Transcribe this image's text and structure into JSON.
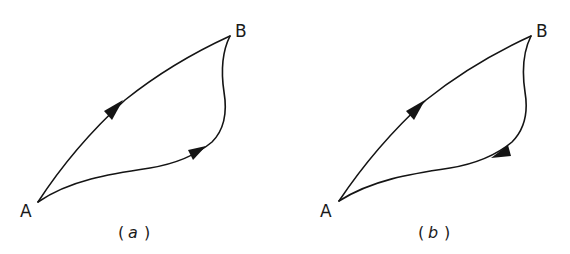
{
  "figure": {
    "stroke_color": "#141414",
    "background": "#ffffff",
    "panels": [
      {
        "id": "a",
        "caption_open": "(",
        "caption_letter": "a",
        "caption_close": ")",
        "point_start": "A",
        "point_end": "B",
        "upper_path_direction": "A to B",
        "lower_path_direction": "A to B"
      },
      {
        "id": "b",
        "caption_open": "(",
        "caption_letter": "b",
        "caption_close": ")",
        "point_start": "A",
        "point_end": "B",
        "upper_path_direction": "A to B",
        "lower_path_direction": "B to A"
      }
    ]
  }
}
